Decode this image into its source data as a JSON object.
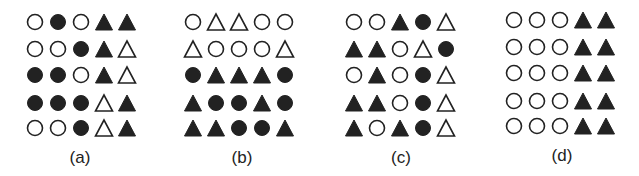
{
  "figure": {
    "colors": {
      "ink": "#222222",
      "background": "#ffffff"
    },
    "legend": {
      "C": "open circle",
      "c": "filled circle",
      "T": "open triangle",
      "t": "filled triangle"
    },
    "panels": [
      {
        "label": "(a)",
        "rows": [
          [
            "open-circle",
            "filled-circle",
            "open-circle",
            "filled-triangle",
            "filled-triangle"
          ],
          [
            "open-circle",
            "open-circle",
            "filled-circle",
            "filled-triangle",
            "open-triangle"
          ],
          [
            "filled-circle",
            "filled-circle",
            "open-circle",
            "filled-triangle",
            "open-triangle"
          ],
          [
            "filled-circle",
            "filled-circle",
            "filled-circle",
            "open-triangle",
            "filled-triangle"
          ],
          [
            "open-circle",
            "open-circle",
            "filled-circle",
            "open-triangle",
            "filled-triangle"
          ]
        ]
      },
      {
        "label": "(b)",
        "rows": [
          [
            "open-circle",
            "open-triangle",
            "open-triangle",
            "open-circle",
            "open-circle"
          ],
          [
            "open-triangle",
            "open-circle",
            "open-circle",
            "open-circle",
            "open-triangle"
          ],
          [
            "filled-circle",
            "filled-triangle",
            "filled-triangle",
            "filled-triangle",
            "filled-circle"
          ],
          [
            "filled-triangle",
            "filled-circle",
            "filled-circle",
            "filled-triangle",
            "filled-circle"
          ],
          [
            "filled-triangle",
            "filled-triangle",
            "filled-circle",
            "filled-circle",
            "filled-triangle"
          ]
        ]
      },
      {
        "label": "(c)",
        "rows": [
          [
            "open-circle",
            "open-circle",
            "filled-triangle",
            "filled-circle",
            "open-triangle"
          ],
          [
            "filled-triangle",
            "filled-triangle",
            "open-circle",
            "open-triangle",
            "filled-circle"
          ],
          [
            "open-circle",
            "filled-triangle",
            "open-circle",
            "filled-circle",
            "open-triangle"
          ],
          [
            "filled-triangle",
            "filled-triangle",
            "open-circle",
            "filled-circle",
            "open-triangle"
          ],
          [
            "filled-triangle",
            "open-circle",
            "filled-triangle",
            "filled-circle",
            "open-triangle"
          ]
        ]
      },
      {
        "label": "(d)",
        "rows": [
          [
            "open-circle",
            "open-circle",
            "open-circle",
            "filled-triangle",
            "filled-triangle"
          ],
          [
            "open-circle",
            "open-circle",
            "open-circle",
            "filled-triangle",
            "filled-triangle"
          ],
          [
            "open-circle",
            "open-circle",
            "open-circle",
            "filled-triangle",
            "filled-triangle"
          ],
          [
            "open-circle",
            "open-circle",
            "open-circle",
            "filled-triangle",
            "filled-triangle"
          ],
          [
            "open-circle",
            "open-circle",
            "open-circle",
            "filled-triangle",
            "filled-triangle"
          ]
        ]
      }
    ]
  }
}
